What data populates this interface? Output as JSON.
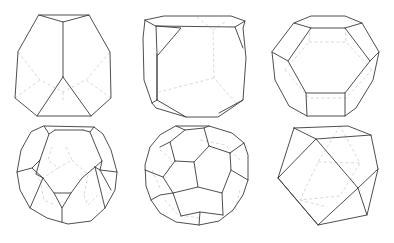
{
  "figure": {
    "layout": {
      "rows": 2,
      "columns": 3
    },
    "style": {
      "visible_edge_color": "#3a3a3a",
      "hidden_edge_color": "#d4d4d4",
      "background": "#ffffff"
    },
    "panels": [
      {
        "position": "row1-col1",
        "shape": "truncated-polyhedron-front-vertex-view"
      },
      {
        "position": "row1-col2",
        "shape": "truncated-cube"
      },
      {
        "position": "row1-col3",
        "shape": "truncated-octahedron"
      },
      {
        "position": "row2-col1",
        "shape": "truncated-dodecahedron"
      },
      {
        "position": "row2-col2",
        "shape": "truncated-icosahedron"
      },
      {
        "position": "row2-col3",
        "shape": "cuboctahedron"
      }
    ]
  }
}
